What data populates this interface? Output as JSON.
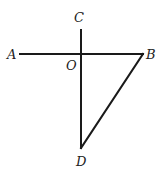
{
  "diagram": {
    "points": {
      "A": {
        "label": "A",
        "x": 20,
        "y": 54
      },
      "B": {
        "label": "B",
        "x": 143,
        "y": 54
      },
      "C": {
        "label": "C",
        "x": 81,
        "y": 30
      },
      "D": {
        "label": "D",
        "x": 81,
        "y": 148
      },
      "O": {
        "label": "O",
        "x": 81,
        "y": 54
      }
    },
    "segments": [
      "AB",
      "CD",
      "BD"
    ],
    "line_color": "#1a1a1a"
  }
}
